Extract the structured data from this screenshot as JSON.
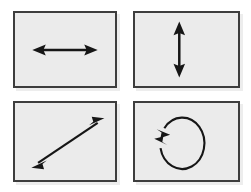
{
  "figure": {
    "background_color": "#ffffff",
    "layout": {
      "rows": 2,
      "columns": 2
    }
  },
  "style": {
    "panel_fill": "#ebebeb",
    "panel_border_color": "#3d3d3d",
    "panel_border_width": 2,
    "arrow_color": "#161616",
    "arrow_line_width": 2,
    "shadow_color": "rgba(0,0,0,0.07)"
  },
  "panels": [
    {
      "id": "horizontal",
      "position": "top-left",
      "icon_name": "horizontal-double-arrow-icon",
      "motion": "horizontal translation",
      "arrow_type": "double-headed straight arrow",
      "orientation": "horizontal",
      "heads": 2,
      "geometry": {
        "x1": 20,
        "y1": 39,
        "x2": 84,
        "y2": 39,
        "head_length": 11,
        "head_width": 12
      }
    },
    {
      "id": "vertical",
      "position": "top-right",
      "icon_name": "vertical-double-arrow-icon",
      "motion": "vertical translation",
      "arrow_type": "double-headed straight arrow",
      "orientation": "vertical",
      "heads": 2,
      "geometry": {
        "x1": 46,
        "y1": 11,
        "x2": 46,
        "y2": 66,
        "head_length": 12,
        "head_width": 12
      }
    },
    {
      "id": "diagonal",
      "position": "bottom-left",
      "icon_name": "diagonal-double-arrow-icon",
      "motion": "diagonal translation",
      "arrow_type": "double-headed straight arrow",
      "orientation": "diagonal lower-left to upper-right",
      "heads": 2,
      "geometry": {
        "x1": 20,
        "y1": 67,
        "x2": 92,
        "y2": 16,
        "head_length": 13,
        "head_width": 12
      }
    },
    {
      "id": "rotation",
      "position": "bottom-right",
      "icon_name": "circular-rotation-arrow-icon",
      "motion": "rotation",
      "arrow_type": "circular arrow with two heads",
      "orientation": "circular, gap on left side",
      "heads": 2,
      "geometry": {
        "cx": 45,
        "cy": 41,
        "rx": 23,
        "ry": 27,
        "head_length": 12,
        "head_width": 12
      }
    }
  ]
}
